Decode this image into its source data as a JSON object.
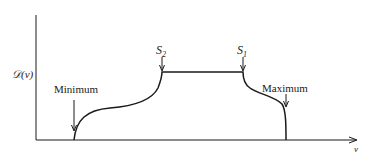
{
  "diagram": {
    "y_axis_label": "𝒟(v)",
    "x_axis_label": "v",
    "annotations": {
      "minimum": "Minimum",
      "maximum": "Maximum",
      "s2": "S",
      "s2_sub": "2",
      "s1": "S",
      "s1_sub": "1"
    },
    "colors": {
      "line": "#1a1a1a",
      "background": "#ffffff"
    }
  }
}
